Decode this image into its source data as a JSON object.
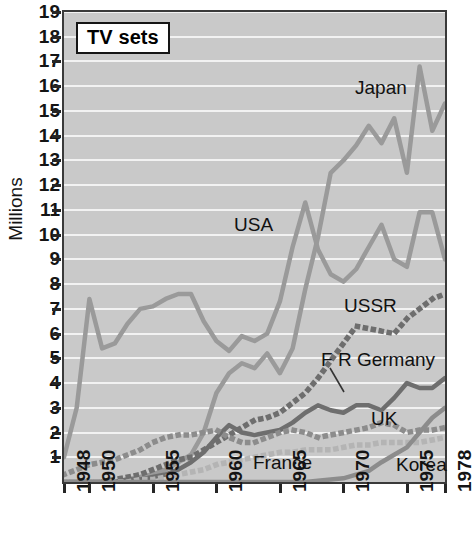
{
  "title": "TV sets",
  "axis": {
    "y_label": "Millions",
    "y_ticks": [
      19,
      18,
      17,
      16,
      15,
      14,
      13,
      12,
      11,
      10,
      9,
      8,
      7,
      6,
      5,
      4,
      3,
      2,
      1
    ],
    "x_ticks": [
      "1948",
      "1950",
      "1955",
      "1960",
      "1965",
      "1970",
      "1975",
      "1978"
    ]
  },
  "annotations": [
    {
      "name": "japan",
      "text": "Japan"
    },
    {
      "name": "usa",
      "text": "USA"
    },
    {
      "name": "ussr",
      "text": "USSR"
    },
    {
      "name": "fr-germany",
      "text": "F R Germany"
    },
    {
      "name": "uk",
      "text": "UK"
    },
    {
      "name": "france",
      "text": "France"
    },
    {
      "name": "korea",
      "text": "Korea"
    }
  ],
  "colors": {
    "plot_background": "#c9c9c9",
    "gridline": "#f2f2f2",
    "frame": "#3a3a3a",
    "light_grey_series": "#9a9a9a",
    "mid_grey_series": "#8c8c8c",
    "dark_grey_series": "#6e6e6e",
    "pale_grey_series": "#b4b4b4",
    "text": "#111111"
  },
  "chart_data": {
    "type": "line",
    "title": "TV sets",
    "xlabel": "",
    "ylabel": "Millions",
    "xlim": [
      1948,
      1978
    ],
    "ylim": [
      0,
      19
    ],
    "grid": true,
    "legend": "inline-annotations",
    "x": [
      1948,
      1949,
      1950,
      1951,
      1952,
      1953,
      1954,
      1955,
      1956,
      1957,
      1958,
      1959,
      1960,
      1961,
      1962,
      1963,
      1964,
      1965,
      1966,
      1967,
      1968,
      1969,
      1970,
      1971,
      1972,
      1973,
      1974,
      1975,
      1976,
      1977,
      1978
    ],
    "series": [
      {
        "name": "USA",
        "style": "solid",
        "color": "#9a9a9a",
        "values": [
          1.0,
          3.0,
          7.4,
          5.4,
          5.6,
          6.4,
          7.0,
          7.1,
          7.4,
          7.6,
          7.6,
          6.5,
          5.7,
          5.3,
          5.9,
          5.7,
          6.0,
          7.3,
          9.5,
          11.3,
          9.4,
          8.4,
          8.1,
          8.6,
          9.5,
          10.4,
          9.0,
          8.7,
          10.9,
          10.9,
          9.0
        ]
      },
      {
        "name": "Japan",
        "style": "solid",
        "color": "#9a9a9a",
        "values": [
          0.0,
          0.0,
          0.0,
          0.0,
          0.0,
          0.1,
          0.2,
          0.3,
          0.5,
          0.8,
          1.1,
          2.0,
          3.6,
          4.4,
          4.8,
          4.6,
          5.2,
          4.4,
          5.4,
          7.8,
          9.9,
          12.5,
          13.0,
          13.6,
          14.4,
          13.7,
          14.7,
          12.5,
          16.8,
          14.2,
          15.3
        ]
      },
      {
        "name": "USSR",
        "style": "dotted",
        "color": "#6e6e6e",
        "values": [
          0.0,
          0.0,
          0.0,
          0.0,
          0.1,
          0.2,
          0.3,
          0.5,
          0.7,
          0.9,
          1.0,
          1.3,
          1.6,
          1.9,
          2.2,
          2.5,
          2.6,
          2.8,
          3.2,
          3.6,
          4.2,
          4.9,
          5.6,
          6.3,
          6.2,
          6.1,
          6.0,
          6.6,
          7.0,
          7.4,
          7.6
        ]
      },
      {
        "name": "F R Germany",
        "style": "solid",
        "color": "#6e6e6e",
        "values": [
          0.0,
          0.0,
          0.0,
          0.0,
          0.0,
          0.1,
          0.1,
          0.2,
          0.3,
          0.5,
          0.8,
          1.2,
          1.8,
          2.3,
          2.0,
          1.9,
          2.0,
          2.1,
          2.4,
          2.8,
          3.1,
          2.9,
          2.8,
          3.1,
          3.1,
          2.9,
          3.4,
          4.0,
          3.8,
          3.8,
          4.2
        ]
      },
      {
        "name": "UK",
        "style": "dotted",
        "color": "#8c8c8c",
        "values": [
          0.3,
          0.5,
          0.7,
          0.8,
          0.9,
          1.1,
          1.3,
          1.6,
          1.8,
          1.9,
          1.9,
          2.0,
          2.1,
          1.8,
          1.6,
          1.6,
          1.8,
          2.0,
          2.1,
          2.0,
          1.8,
          1.9,
          2.0,
          2.1,
          2.2,
          2.4,
          2.3,
          2.0,
          2.1,
          2.1,
          2.2
        ]
      },
      {
        "name": "France",
        "style": "dotted",
        "color": "#b4b4b4",
        "values": [
          0.0,
          0.0,
          0.0,
          0.0,
          0.0,
          0.0,
          0.1,
          0.1,
          0.2,
          0.3,
          0.4,
          0.5,
          0.7,
          0.8,
          0.9,
          1.0,
          1.1,
          1.2,
          1.2,
          1.3,
          1.3,
          1.3,
          1.4,
          1.5,
          1.5,
          1.6,
          1.6,
          1.6,
          1.6,
          1.7,
          1.8
        ]
      },
      {
        "name": "Korea",
        "style": "solid",
        "color": "#8c8c8c",
        "values": [
          0.0,
          0.0,
          0.0,
          0.0,
          0.0,
          0.0,
          0.0,
          0.0,
          0.0,
          0.0,
          0.0,
          0.0,
          0.0,
          0.0,
          0.0,
          0.0,
          0.0,
          0.0,
          0.0,
          0.0,
          0.05,
          0.1,
          0.15,
          0.3,
          0.45,
          0.8,
          1.1,
          1.4,
          2.0,
          2.6,
          3.0
        ]
      }
    ]
  }
}
